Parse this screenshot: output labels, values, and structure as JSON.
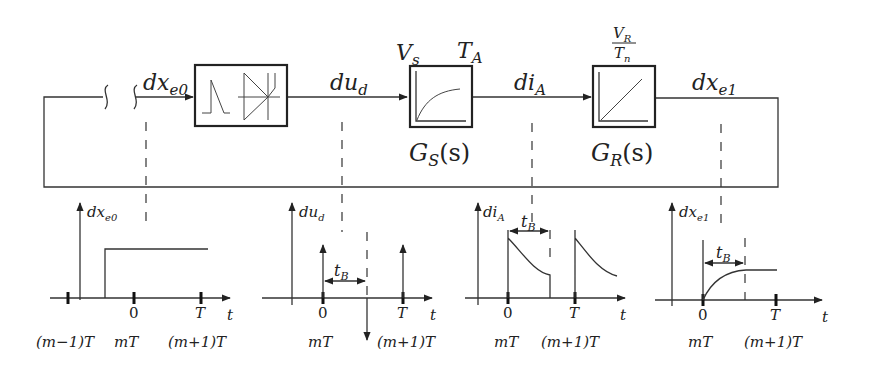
{
  "diagram": {
    "signals": {
      "input": {
        "base": "dx",
        "sub": "e0"
      },
      "converter_out": {
        "base": "du",
        "sub": "d"
      },
      "plant_out": {
        "base": "di",
        "sub": "A"
      },
      "controller_out": {
        "base": "dx",
        "sub": "e1"
      }
    },
    "blocks": [
      {
        "id": "pwm-converter",
        "description": "sawtooth modulator and thyristor"
      },
      {
        "id": "plant",
        "top_left": {
          "base": "V",
          "sub": "s"
        },
        "top_right": {
          "base": "T",
          "sub": "A"
        },
        "bottom": {
          "base": "G",
          "sub": "S",
          "arg": "(s)"
        },
        "response": "first-order lag"
      },
      {
        "id": "controller",
        "top_num": {
          "base": "V",
          "sub": "R"
        },
        "top_den": {
          "base": "T",
          "sub": "n"
        },
        "bottom": {
          "base": "G",
          "sub": "R",
          "arg": "(s)"
        },
        "response": "integrator ramp"
      }
    ],
    "plots": [
      {
        "ylabel": {
          "base": "dx",
          "sub": "e0"
        },
        "xlabel": "t",
        "ticks": [
          "0",
          "T"
        ],
        "time_labels": [
          "(m−1)T",
          "mT",
          "(m+1)T"
        ],
        "shape": "step"
      },
      {
        "ylabel": {
          "base": "du",
          "sub": "d"
        },
        "xlabel": "t",
        "ticks": [
          "0",
          "T"
        ],
        "time_labels": [
          "mT",
          "(m+1)T"
        ],
        "interval": {
          "base": "t",
          "sub": "B"
        },
        "shape": "impulses"
      },
      {
        "ylabel": {
          "base": "di",
          "sub": "A"
        },
        "xlabel": "t",
        "ticks": [
          "0",
          "T"
        ],
        "time_labels": [
          "mT",
          "(m+1)T"
        ],
        "interval": {
          "base": "t",
          "sub": "B"
        },
        "shape": "decaying pulses"
      },
      {
        "ylabel": {
          "base": "dx",
          "sub": "e1"
        },
        "xlabel": "t",
        "ticks": [
          "0",
          "T"
        ],
        "time_labels": [
          "mT",
          "(m+1)T"
        ],
        "interval": {
          "base": "t",
          "sub": "B"
        },
        "shape": "exponential rise to plateau"
      }
    ]
  }
}
